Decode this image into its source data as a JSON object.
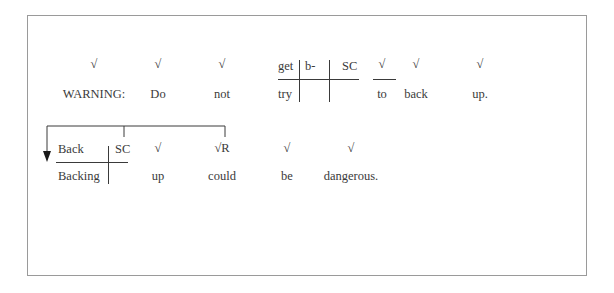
{
  "diagram": {
    "line1": {
      "tokens": [
        {
          "marker": "√",
          "word": "WARNING:"
        },
        {
          "marker": "√",
          "word": "Do"
        },
        {
          "marker": "√",
          "word": "not"
        },
        {
          "marker": "√",
          "word": "to"
        },
        {
          "marker": "√",
          "word": "back"
        },
        {
          "marker": "√",
          "word": "up."
        }
      ],
      "compound": {
        "top_left": "get",
        "top_mid": "b-",
        "top_right": "SC",
        "bottom_left": "try"
      }
    },
    "line2": {
      "compound": {
        "top_left": "Back",
        "top_right": "SC",
        "bottom_left": "Backing"
      },
      "tokens": [
        {
          "marker": "√",
          "word": "up"
        },
        {
          "marker": "√R",
          "word": "could"
        },
        {
          "marker": "√",
          "word": "be"
        },
        {
          "marker": "√",
          "word": "dangerous."
        }
      ]
    }
  }
}
